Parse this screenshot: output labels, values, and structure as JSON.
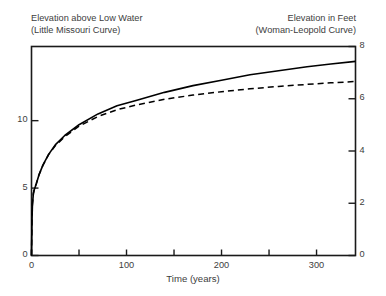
{
  "headers": {
    "left_line1": "Elevation above Low Water",
    "left_line2": "(Little Missouri Curve)",
    "right_line1": "Elevation in Feet",
    "right_line2": "(Woman-Leopold Curve)"
  },
  "axes": {
    "x_label": "Time (years)",
    "x_ticks": [
      "0",
      "100",
      "200",
      "300"
    ],
    "x_tick_values": [
      0,
      100,
      200,
      300
    ],
    "x_minor_values": [
      50,
      150,
      250
    ],
    "x_range": [
      0,
      341
    ],
    "y_left_ticks": [
      "0",
      "5",
      "10"
    ],
    "y_left_tick_values": [
      0,
      5,
      10
    ],
    "y_left_range": [
      0,
      15.5
    ],
    "y_right_ticks": [
      "0",
      "2",
      "4",
      "6",
      "8"
    ],
    "y_right_tick_values": [
      0,
      2,
      4,
      6,
      8
    ],
    "y_right_range": [
      0,
      8
    ]
  },
  "style": {
    "axis_color": "#1a1a1a",
    "curve_color": "#000000",
    "background": "#ffffff"
  },
  "chart_data": {
    "type": "line",
    "xlabel": "Time (years)",
    "ylabel": "Elevation above Low Water",
    "ylabel_right": "Elevation in Feet",
    "xlim": [
      0,
      341
    ],
    "ylim": [
      0,
      15.5
    ],
    "ylim_right": [
      0,
      8
    ],
    "grid": false,
    "legend": "none",
    "series": [
      {
        "name": "Little Missouri Curve",
        "linestyle": "solid",
        "axis": "left",
        "x": [
          0,
          0.5,
          1,
          2,
          3,
          5,
          8,
          12,
          18,
          25,
          35,
          50,
          70,
          90,
          110,
          140,
          170,
          200,
          230,
          260,
          290,
          315,
          341
        ],
        "y": [
          0,
          2.6,
          3.8,
          4.6,
          4.9,
          5.3,
          6.0,
          6.7,
          7.5,
          8.2,
          8.9,
          9.7,
          10.5,
          11.1,
          11.5,
          12.1,
          12.6,
          13.0,
          13.4,
          13.7,
          14.0,
          14.2,
          14.4
        ]
      },
      {
        "name": "Woman-Leopold Curve",
        "linestyle": "dashed",
        "axis": "right",
        "x": [
          0,
          0.5,
          1,
          2,
          3,
          5,
          8,
          12,
          18,
          25,
          35,
          50,
          70,
          90,
          110,
          140,
          170,
          200,
          230,
          260,
          290,
          315,
          341
        ],
        "y": [
          0,
          1.35,
          1.95,
          2.38,
          2.55,
          2.75,
          3.1,
          3.45,
          3.86,
          4.2,
          4.55,
          4.95,
          5.32,
          5.58,
          5.76,
          5.98,
          6.14,
          6.27,
          6.38,
          6.47,
          6.55,
          6.61,
          6.66
        ]
      }
    ]
  }
}
